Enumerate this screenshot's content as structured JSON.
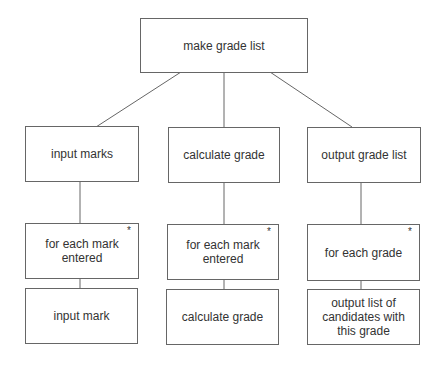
{
  "diagram": {
    "type": "jackson-structure-diagram",
    "root": {
      "label": "make grade list"
    },
    "columns": [
      {
        "component": "input marks",
        "iteration": {
          "label": "for each mark entered",
          "marker": "*"
        },
        "leaf": "input mark"
      },
      {
        "component": "calculate grade",
        "iteration": {
          "label": "for each mark entered",
          "marker": "*"
        },
        "leaf": "calculate grade"
      },
      {
        "component": "output grade list",
        "iteration": {
          "label": "for each grade",
          "marker": "*"
        },
        "leaf": "output list of candidates with this grade"
      }
    ],
    "colors": {
      "border": "#666666",
      "text": "#333333",
      "background": "#ffffff"
    }
  }
}
